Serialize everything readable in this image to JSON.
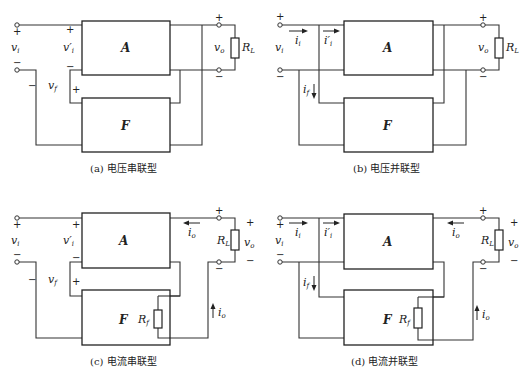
{
  "figure": {
    "panels": [
      {
        "id": "a",
        "caption": "(a) 电压串联型",
        "amp_label": "A",
        "fb_label": "F",
        "labels": {
          "vi": "v",
          "vi_sub": "i",
          "vip": "v′",
          "vip_sub": "i",
          "vf": "v",
          "vf_sub": "f",
          "vo": "v",
          "vo_sub": "o",
          "RL": "R",
          "RL_sub": "L"
        },
        "signs": {
          "plus": "+",
          "minus": "−"
        }
      },
      {
        "id": "b",
        "caption": "(b) 电压并联型",
        "amp_label": "A",
        "fb_label": "F",
        "labels": {
          "vi": "v",
          "vi_sub": "i",
          "ii": "i",
          "ii_sub": "i",
          "iip": "i′",
          "iip_sub": "i",
          "if": "i",
          "if_sub": "f",
          "vo": "v",
          "vo_sub": "o",
          "RL": "R",
          "RL_sub": "L"
        },
        "signs": {
          "plus": "+",
          "minus": "−"
        }
      },
      {
        "id": "c",
        "caption": "(c) 电流串联型",
        "amp_label": "A",
        "fb_label": "F",
        "labels": {
          "vi": "v",
          "vi_sub": "i",
          "vip": "v′",
          "vip_sub": "i",
          "vf": "v",
          "vf_sub": "f",
          "io": "i",
          "io_sub": "o",
          "vo": "v",
          "vo_sub": "o",
          "RL": "R",
          "RL_sub": "L",
          "Rf": "R",
          "Rf_sub": "f"
        },
        "signs": {
          "plus": "+",
          "minus": "−"
        }
      },
      {
        "id": "d",
        "caption": "(d) 电流并联型",
        "amp_label": "A",
        "fb_label": "F",
        "labels": {
          "vi": "v",
          "vi_sub": "i",
          "ii": "i",
          "ii_sub": "i",
          "iip": "i′",
          "iip_sub": "i",
          "if": "i",
          "if_sub": "f",
          "io": "i",
          "io_sub": "o",
          "vo": "v",
          "vo_sub": "o",
          "RL": "R",
          "RL_sub": "L",
          "Rf": "R",
          "Rf_sub": "f"
        },
        "signs": {
          "plus": "+",
          "minus": "−"
        }
      }
    ]
  }
}
